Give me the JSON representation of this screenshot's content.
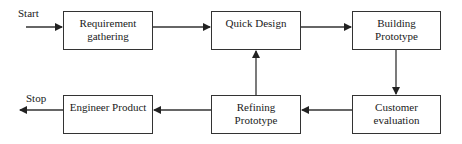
{
  "diagram": {
    "start_label": "Start",
    "stop_label": "Stop",
    "nodes": [
      {
        "id": "requirement",
        "label": "Requirement gathering"
      },
      {
        "id": "quick-design",
        "label": "Quick Design"
      },
      {
        "id": "building",
        "label": "Building Prototype"
      },
      {
        "id": "customer",
        "label": "Customer evaluation"
      },
      {
        "id": "refining",
        "label": "Refining Prototype"
      },
      {
        "id": "engineer",
        "label": "Engineer Product"
      }
    ],
    "edges": [
      [
        "Start",
        "requirement"
      ],
      [
        "requirement",
        "quick-design"
      ],
      [
        "quick-design",
        "building"
      ],
      [
        "building",
        "customer"
      ],
      [
        "customer",
        "refining"
      ],
      [
        "refining",
        "quick-design"
      ],
      [
        "refining",
        "engineer"
      ],
      [
        "engineer",
        "Stop"
      ]
    ]
  }
}
